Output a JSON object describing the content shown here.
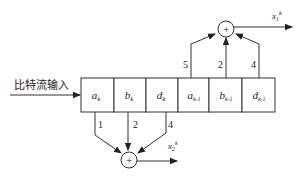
{
  "diagram": {
    "input_label": "比特流输入",
    "register_cells": [
      {
        "main": "a",
        "sub": "k"
      },
      {
        "main": "b",
        "sub": "k"
      },
      {
        "main": "d",
        "sub": "k"
      },
      {
        "main": "a",
        "sub": "k-1"
      },
      {
        "main": "b",
        "sub": "k-1"
      },
      {
        "main": "d",
        "sub": "k-1"
      }
    ],
    "top_adder": {
      "symbol": "+",
      "tap_weights": [
        "5",
        "2",
        "4"
      ],
      "output": {
        "main": "x",
        "sub": "1",
        "sup": "k"
      }
    },
    "bottom_adder": {
      "symbol": "+",
      "tap_weights": [
        "1",
        "2",
        "4"
      ],
      "output": {
        "main": "x",
        "sub": "2",
        "sup": "k"
      }
    }
  }
}
